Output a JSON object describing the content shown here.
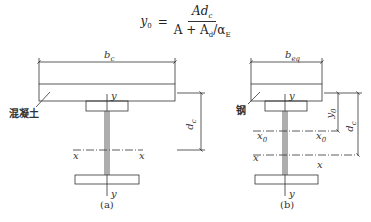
{
  "formula": {
    "lhs": "y",
    "lhs_sub": "0",
    "equals": "=",
    "numerator": "Ad",
    "numerator_sub": "c",
    "denominator_a": "A + A",
    "denominator_sub": "d",
    "denominator_slash": "/α",
    "denominator_sub2": "E"
  },
  "figure_a": {
    "caption": "(a)",
    "width_label": "b",
    "width_sub": "c",
    "material_label": "混凝土",
    "depth_label": "d",
    "depth_sub": "c",
    "y_top": "y",
    "y_bottom": "y",
    "x_left": "x",
    "x_right": "x"
  },
  "figure_b": {
    "caption": "(b)",
    "width_label": "b",
    "width_sub": "eq",
    "material_label": "钢",
    "y0_label": "y",
    "y0_sub": "0",
    "depth_label": "d",
    "depth_sub": "c",
    "y_top": "y",
    "y_bottom": "y",
    "x0_left": "x",
    "x0_left_sub": "0",
    "x0_right": "x",
    "x0_right_sub": "0",
    "x_left": "x",
    "x_right": "x"
  },
  "colors": {
    "line": "#333333",
    "background": "#ffffff"
  }
}
